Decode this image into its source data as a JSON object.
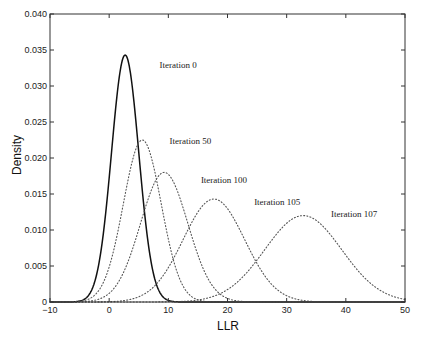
{
  "chart_data": {
    "type": "line",
    "title": "",
    "xlabel": "LLR",
    "ylabel": "Density",
    "xlim": [
      -10,
      50
    ],
    "ylim": [
      0,
      0.04
    ],
    "xticks": [
      -10,
      0,
      10,
      20,
      30,
      40,
      50
    ],
    "xtick_labels": [
      "−10",
      "0",
      "10",
      "20",
      "30",
      "40",
      "50"
    ],
    "yticks": [
      0,
      0.005,
      0.01,
      0.015,
      0.02,
      0.025,
      0.03,
      0.035,
      0.04
    ],
    "ytick_labels": [
      "0",
      "0.005",
      "0.010",
      "0.015",
      "0.020",
      "0.025",
      "0.030",
      "0.035",
      "0.040"
    ],
    "grid": false,
    "legend": "none (inline annotations)",
    "series": [
      {
        "name": "Iteration 0",
        "style": "solid",
        "shape": "gaussian",
        "mean": 2.7,
        "sigma": 2.3,
        "peak": 0.0343,
        "label_pos": [
          8.5,
          0.0325
        ]
      },
      {
        "name": "Iteration 50",
        "style": "dotted",
        "shape": "gaussian",
        "mean": 5.6,
        "sigma": 3.2,
        "peak": 0.0225,
        "label_pos": [
          10.2,
          0.022
        ]
      },
      {
        "name": "Iteration 100",
        "style": "dotted",
        "shape": "gaussian",
        "mean": 9.3,
        "sigma": 4.0,
        "peak": 0.018,
        "label_pos": [
          15.5,
          0.0165
        ]
      },
      {
        "name": "Iteration 105",
        "style": "dotted",
        "shape": "gaussian",
        "mean": 17.7,
        "sigma": 5.2,
        "peak": 0.0143,
        "label_pos": [
          24.5,
          0.0135
        ]
      },
      {
        "name": "Iteration 107",
        "style": "dotted",
        "shape": "gaussian",
        "mean": 32.8,
        "sigma": 6.5,
        "peak": 0.012,
        "label_pos": [
          37.5,
          0.0118
        ]
      }
    ]
  }
}
